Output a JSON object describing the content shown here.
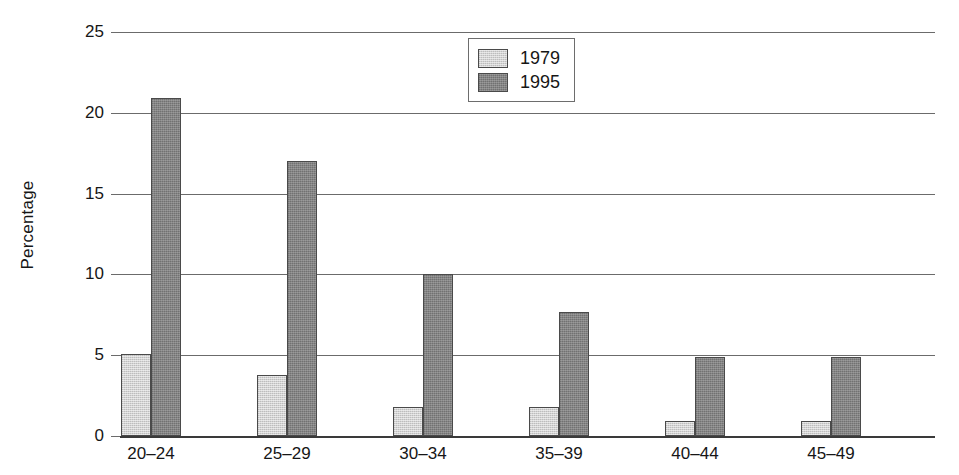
{
  "chart_data": {
    "type": "bar",
    "title": "",
    "xlabel": "",
    "ylabel": "Percentage",
    "categories": [
      "20–24",
      "25–29",
      "30–34",
      "35–39",
      "40–44",
      "45–49"
    ],
    "series": [
      {
        "name": "1979",
        "color": "#d2d2d2",
        "values": [
          5.1,
          3.8,
          1.8,
          1.8,
          0.9,
          0.9
        ]
      },
      {
        "name": "1995",
        "color": "#848484",
        "values": [
          20.9,
          17.0,
          10.0,
          7.7,
          4.9,
          4.9
        ]
      }
    ],
    "ylim": [
      0,
      25
    ],
    "ytick_labels": [
      "0",
      "5",
      "10",
      "15",
      "20",
      "25"
    ],
    "ytick_values": [
      0,
      5,
      10,
      15,
      20,
      25
    ],
    "grid": "horizontal",
    "legend_position": "top-center"
  },
  "legend": {
    "entries": [
      "1979",
      "1995"
    ]
  }
}
